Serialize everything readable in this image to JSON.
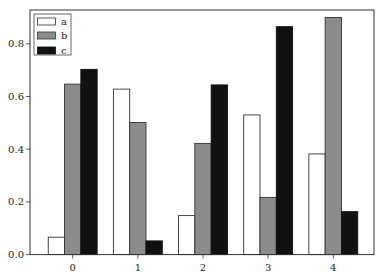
{
  "chart_data": {
    "type": "bar",
    "title": "",
    "xlabel": "",
    "ylabel": "",
    "categories": [
      "0",
      "1",
      "2",
      "3",
      "4"
    ],
    "series": [
      {
        "name": "a",
        "color": "#ffffff",
        "edge": "#333333",
        "values": [
          0.066,
          0.628,
          0.148,
          0.53,
          0.382
        ]
      },
      {
        "name": "b",
        "color": "#8c8c8c",
        "edge": "#333333",
        "values": [
          0.647,
          0.501,
          0.422,
          0.217,
          0.9
        ]
      },
      {
        "name": "c",
        "color": "#111111",
        "edge": "#111111",
        "values": [
          0.703,
          0.052,
          0.644,
          0.865,
          0.163
        ]
      }
    ],
    "yticks": [
      "0.0",
      "0.2",
      "0.4",
      "0.6",
      "0.8"
    ],
    "ylim": [
      0,
      0.92
    ],
    "grid": false,
    "legend_position": "upper left"
  },
  "legend": {
    "items": [
      {
        "label": "a"
      },
      {
        "label": "b"
      },
      {
        "label": "c"
      }
    ]
  }
}
